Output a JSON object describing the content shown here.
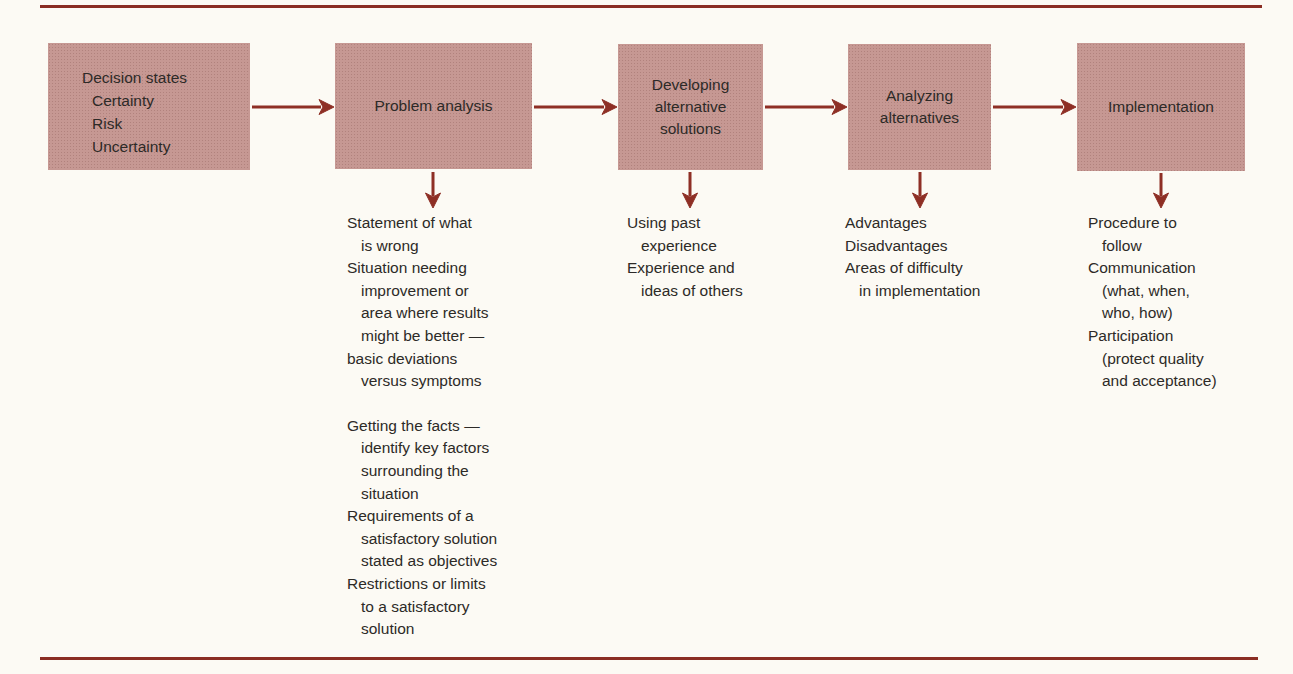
{
  "palette": {
    "background": "#fcfaf4",
    "box_fill": "#c69893",
    "arrow": "#8e2f25",
    "rule": "#8a2d23",
    "text": "#2d2a27"
  },
  "boxes": {
    "decision_states": {
      "lines": [
        "Decision states",
        "Certainty",
        "Risk",
        "Uncertainty"
      ]
    },
    "problem_analysis": {
      "lines": [
        "Problem analysis"
      ]
    },
    "developing_alternative_solutions": {
      "lines": [
        "Developing",
        "alternative",
        "solutions"
      ]
    },
    "analyzing_alternatives": {
      "lines": [
        "Analyzing",
        "alternatives"
      ]
    },
    "implementation": {
      "lines": [
        "Implementation"
      ]
    }
  },
  "notes": {
    "problem_analysis": [
      "Statement of what",
      "is wrong",
      "Situation needing",
      "improvement or",
      "area where results",
      "might be better —",
      "basic deviations",
      "versus symptoms",
      "Getting the facts —",
      "identify key factors",
      "surrounding the",
      "situation",
      "Requirements of a",
      "satisfactory solution",
      "stated as objectives",
      "Restrictions or limits",
      "to a satisfactory",
      "solution"
    ],
    "developing_alternative_solutions": [
      "Using past",
      "experience",
      "Experience and",
      "ideas of others"
    ],
    "analyzing_alternatives": [
      "Advantages",
      "Disadvantages",
      "Areas of difficulty",
      "in implementation"
    ],
    "implementation": [
      "Procedure to",
      "follow",
      "Communication",
      "(what, when,",
      "who, how)",
      "Participation",
      "(protect quality",
      "and acceptance)"
    ]
  }
}
